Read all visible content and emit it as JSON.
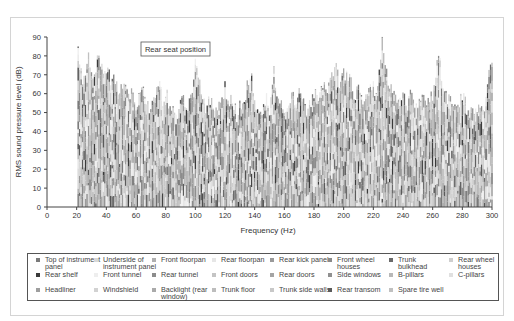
{
  "chart_data": {
    "type": "bar",
    "subtype": "stacked",
    "title": "",
    "annotation": "Rear seat position",
    "xlabel": "Frequency (Hz)",
    "ylabel": "RMS sound pressure level (dB)",
    "xlim": [
      0,
      300
    ],
    "ylim": [
      0,
      90
    ],
    "x_ticks": [
      0,
      20,
      40,
      60,
      80,
      100,
      120,
      140,
      160,
      180,
      200,
      220,
      240,
      260,
      280,
      300
    ],
    "y_ticks": [
      0,
      10,
      20,
      30,
      40,
      50,
      60,
      70,
      80,
      90
    ],
    "grid": false,
    "legend_position": "bottom",
    "envelope_note": "Approximate top of stacked bars (total level, dB) vs frequency (Hz)",
    "x": [
      21,
      22,
      24,
      26,
      28,
      30,
      32,
      35,
      38,
      40,
      43,
      45,
      48,
      50,
      52,
      55,
      57,
      60,
      63,
      65,
      68,
      70,
      73,
      75,
      78,
      80,
      83,
      85,
      88,
      90,
      93,
      95,
      98,
      100,
      102,
      105,
      108,
      110,
      113,
      115,
      118,
      120,
      123,
      125,
      128,
      130,
      133,
      135,
      138,
      140,
      143,
      145,
      148,
      150,
      153,
      156,
      158,
      160,
      163,
      165,
      168,
      170,
      173,
      175,
      178,
      180,
      183,
      185,
      187,
      189,
      191,
      193,
      195,
      197,
      200,
      203,
      205,
      208,
      210,
      213,
      215,
      218,
      220,
      222,
      224,
      226,
      228,
      230,
      233,
      235,
      238,
      240,
      243,
      245,
      248,
      250,
      253,
      255,
      258,
      260,
      262,
      264,
      266,
      268,
      270,
      273,
      275,
      278,
      280,
      283,
      285,
      288,
      290,
      293,
      295,
      298,
      300
    ],
    "values": [
      89,
      75,
      65,
      66,
      82,
      68,
      72,
      80,
      70,
      72,
      68,
      69,
      60,
      64,
      67,
      58,
      59,
      52,
      62,
      63,
      55,
      50,
      58,
      67,
      56,
      62,
      52,
      55,
      50,
      60,
      53,
      54,
      60,
      75,
      68,
      56,
      52,
      58,
      49,
      53,
      57,
      63,
      54,
      58,
      48,
      56,
      52,
      64,
      68,
      55,
      53,
      52,
      59,
      50,
      72,
      55,
      53,
      52,
      57,
      60,
      54,
      60,
      55,
      50,
      54,
      58,
      60,
      64,
      68,
      62,
      72,
      70,
      76,
      65,
      70,
      69,
      66,
      58,
      66,
      57,
      60,
      64,
      66,
      58,
      74,
      88,
      76,
      68,
      62,
      60,
      56,
      58,
      54,
      60,
      56,
      52,
      58,
      55,
      56,
      60,
      72,
      80,
      70,
      62,
      56,
      55,
      57,
      54,
      60,
      52,
      54,
      50,
      53,
      52,
      48,
      72,
      75
    ],
    "series": [
      {
        "name": "Top of instrument panel",
        "color": "#7a7a7a"
      },
      {
        "name": "Underside of instrument panel",
        "color": "#d8d8d8"
      },
      {
        "name": "Front floorpan",
        "color": "#b0b0b0"
      },
      {
        "name": "Rear floorpan",
        "color": "#e6e6e6"
      },
      {
        "name": "Rear kick panel",
        "color": "#9a9a9a"
      },
      {
        "name": "Front wheel houses",
        "color": "#8a8a8a"
      },
      {
        "name": "Trunk bulkhead",
        "color": "#6a6a6a"
      },
      {
        "name": "Rear wheel houses",
        "color": "#cfcfcf"
      },
      {
        "name": "Rear shelf",
        "color": "#3a3a3a"
      },
      {
        "name": "Front tunnel",
        "color": "#eeeeee"
      },
      {
        "name": "Rear tunnel",
        "color": "#8c8c8c"
      },
      {
        "name": "Front doors",
        "color": "#c4c4c4"
      },
      {
        "name": "Rear doors",
        "color": "#a4a4a4"
      },
      {
        "name": "Side windows",
        "color": "#909090"
      },
      {
        "name": "B-pillars",
        "color": "#b8b8b8"
      },
      {
        "name": "C-pillars",
        "color": "#e0e0e0"
      },
      {
        "name": "Headliner",
        "color": "#9e9e9e"
      },
      {
        "name": "Windshield",
        "color": "#d2d2d2"
      },
      {
        "name": "Backlight (rear window)",
        "color": "#aaaaaa"
      },
      {
        "name": "Trunk floor",
        "color": "#bdbdbd"
      },
      {
        "name": "Trunk side walls",
        "color": "#c8c8c8"
      },
      {
        "name": "Rear transom",
        "color": "#5a5a5a"
      },
      {
        "name": "Spare tire well",
        "color": "#c0c0c0"
      }
    ]
  },
  "legend": {
    "items": [
      {
        "label": "Top of instrument\npanel",
        "color": "#7a7a7a"
      },
      {
        "label": "Underside of\ninstrument panel",
        "color": "#d8d8d8"
      },
      {
        "label": "Front floorpan",
        "color": "#b0b0b0"
      },
      {
        "label": "Rear floorpan",
        "color": "#e6e6e6"
      },
      {
        "label": "Rear kick panel",
        "color": "#9a9a9a"
      },
      {
        "label": "Front wheel\nhouses",
        "color": "#8a8a8a"
      },
      {
        "label": "Trunk\nbulkhead",
        "color": "#6a6a6a"
      },
      {
        "label": "Rear wheel\nhouses",
        "color": "#cfcfcf"
      },
      {
        "label": "Rear shelf",
        "color": "#3a3a3a"
      },
      {
        "label": "Front tunnel",
        "color": "#eeeeee"
      },
      {
        "label": "Rear tunnel",
        "color": "#8c8c8c"
      },
      {
        "label": "Front doors",
        "color": "#c4c4c4"
      },
      {
        "label": "Rear doors",
        "color": "#a4a4a4"
      },
      {
        "label": "Side windows",
        "color": "#909090"
      },
      {
        "label": "B-pillars",
        "color": "#b8b8b8"
      },
      {
        "label": "C-pillars",
        "color": "#e0e0e0"
      },
      {
        "label": "Headliner",
        "color": "#9e9e9e"
      },
      {
        "label": "Windshield",
        "color": "#d2d2d2"
      },
      {
        "label": "Backlight (rear\nwindow)",
        "color": "#aaaaaa"
      },
      {
        "label": "Trunk floor",
        "color": "#bdbdbd"
      },
      {
        "label": "Trunk side walls",
        "color": "#c8c8c8"
      },
      {
        "label": "Rear transom",
        "color": "#5a5a5a"
      },
      {
        "label": "Spare tire well",
        "color": "#c0c0c0"
      }
    ]
  }
}
